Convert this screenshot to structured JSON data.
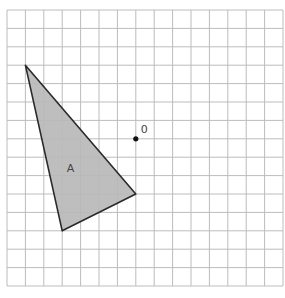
{
  "diagram": {
    "type": "grid-transformation",
    "grid": {
      "columns": 15,
      "rows": 15,
      "origin_px": [
        7,
        10
      ],
      "cell_px": 18.4,
      "line_color": "#bcbcbc"
    },
    "shape": {
      "label": "A",
      "kind": "triangle",
      "vertices_grid": [
        [
          1,
          3
        ],
        [
          7,
          10
        ],
        [
          3,
          12
        ]
      ],
      "fill_color": "#b9b9b9",
      "stroke_color": "#2a2a2a",
      "label_pos_grid": [
        3.45,
        8.6
      ]
    },
    "point": {
      "label": "0",
      "pos_grid": [
        7,
        7
      ],
      "color": "#111111",
      "label_offset_px": [
        5,
        -6
      ]
    }
  }
}
